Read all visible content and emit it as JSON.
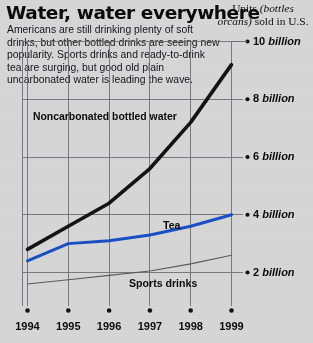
{
  "header": {
    "title": "Water, water everywhere",
    "subtitle": "Americans are still drinking plenty of soft drinks, but other bottled drinks are seeing new popularity. Sports drinks and ready-to-drink tea are surging, but good old plain uncarbonated water is leading the wave.",
    "units_line1_plain": "Units ",
    "units_line1_italic": "(bottles or",
    "units_line2_italic": "cans)",
    "units_line2_plain": " sold in U.S."
  },
  "colors": {
    "background": "#d6d6d6",
    "water_line": "#141414",
    "tea_line": "#1a4fc4",
    "sports_line": "#5b5b5b",
    "grid": "#6f6f75",
    "axis": "#4a4a50",
    "text": "#111111"
  },
  "chart_data": {
    "type": "line",
    "title": "Water, water everywhere",
    "subtitle": "Americans are still drinking plenty of soft drinks, but other bottled drinks are seeing new popularity. Sports drinks and ready-to-drink tea are surging, but good old plain uncarbonated water is leading the wave.",
    "xlabel": "",
    "ylabel": "Units (bottles or cans) sold in U.S.",
    "x": [
      1994,
      1995,
      1996,
      1997,
      1998,
      1999
    ],
    "xtick_labels": [
      "1994",
      "1995",
      "1996",
      "1997",
      "1998",
      "1999"
    ],
    "ytick_values": [
      2,
      4,
      6,
      8,
      10
    ],
    "ytick_labels": [
      "2 billion",
      "4 billion",
      "6 billion",
      "8 billion",
      "10 billion"
    ],
    "ylim": [
      0.6,
      10.4
    ],
    "xlim": [
      1994,
      1999
    ],
    "grid": true,
    "legend_position": "inline-annotations",
    "units": "billion units (bottles or cans)",
    "series": [
      {
        "name": "Noncarbonated bottled water",
        "color": "#141414",
        "width": 3.6,
        "values": [
          2.8,
          3.6,
          4.4,
          5.6,
          7.2,
          9.2
        ],
        "label_x": 1995.0,
        "label_y": 7.0
      },
      {
        "name": "Tea",
        "color": "#1a4fc4",
        "width": 3.0,
        "values": [
          2.4,
          3.0,
          3.1,
          3.3,
          3.6,
          4.0
        ],
        "label_x": 1996.9,
        "label_y": 3.9
      },
      {
        "name": "Sports drinks",
        "color": "#5b5b5b",
        "width": 1.1,
        "values": [
          1.6,
          1.75,
          1.9,
          2.05,
          2.3,
          2.6
        ],
        "label_x": 1996.3,
        "label_y": 1.5
      }
    ]
  }
}
